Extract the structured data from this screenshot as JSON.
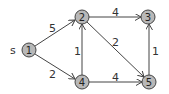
{
  "graph": {
    "source_label": "s",
    "nodes": [
      {
        "id": "1",
        "label": "1",
        "x": 29,
        "y": 50
      },
      {
        "id": "2",
        "label": "2",
        "x": 82,
        "y": 17
      },
      {
        "id": "3",
        "label": "3",
        "x": 148,
        "y": 17
      },
      {
        "id": "4",
        "label": "4",
        "x": 82,
        "y": 82
      },
      {
        "id": "5",
        "label": "5",
        "x": 149,
        "y": 82
      }
    ],
    "edges": [
      {
        "from": "1",
        "to": "2",
        "weight": "5"
      },
      {
        "from": "1",
        "to": "4",
        "weight": "2"
      },
      {
        "from": "2",
        "to": "3",
        "weight": "4"
      },
      {
        "from": "2",
        "to": "5",
        "weight": "2"
      },
      {
        "from": "4",
        "to": "2",
        "weight": "1"
      },
      {
        "from": "4",
        "to": "5",
        "weight": "4"
      },
      {
        "from": "5",
        "to": "3",
        "weight": "1"
      }
    ],
    "colors": {
      "node_fill": "#b8b8b8",
      "stroke": "#444444"
    }
  }
}
